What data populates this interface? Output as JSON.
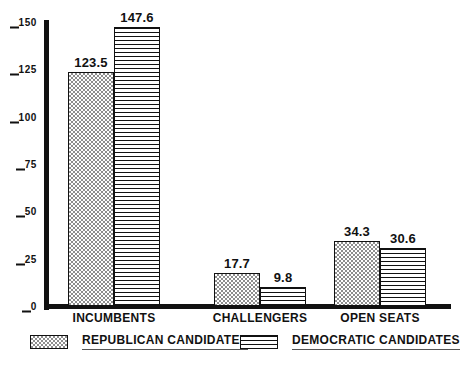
{
  "chart_data": {
    "type": "bar",
    "title": "",
    "subtitle": "",
    "xlabel": "",
    "ylabel": "",
    "ylim": [
      0,
      150
    ],
    "yticks": [
      0,
      25,
      50,
      75,
      100,
      125,
      150
    ],
    "ytick_labels": [
      "0",
      "25",
      "50",
      "75",
      "100",
      "125",
      "150"
    ],
    "grid": false,
    "legend_position": "bottom",
    "categories": [
      "INCUMBENTS",
      "CHALLENGERS",
      "OPEN SEATS"
    ],
    "series": [
      {
        "name": "REPUBLICAN CANDIDATES",
        "pattern": "checkerboard-stipple",
        "values": [
          123.5,
          147.6,
          17.7
        ],
        "value_labels": [
          "123.5",
          "17.7",
          "34.3"
        ],
        "values_by_category": [
          123.5,
          17.7,
          34.3
        ]
      },
      {
        "name": "DEMOCRATIC CANDIDATES",
        "pattern": "horizontal-lines",
        "values": [
          147.6,
          9.8,
          30.6
        ],
        "value_labels": [
          "147.6",
          "9.8",
          "30.6"
        ],
        "values_by_category": [
          147.6,
          9.8,
          30.6
        ]
      }
    ],
    "groups": [
      {
        "category": "INCUMBENTS",
        "bars": [
          {
            "series": "REPUBLICAN CANDIDATES",
            "value": 123.5,
            "label": "123.5"
          },
          {
            "series": "DEMOCRATIC CANDIDATES",
            "value": 147.6,
            "label": "147.6"
          }
        ]
      },
      {
        "category": "CHALLENGERS",
        "bars": [
          {
            "series": "REPUBLICAN CANDIDATES",
            "value": 17.7,
            "label": "17.7"
          },
          {
            "series": "DEMOCRATIC CANDIDATES",
            "value": 9.8,
            "label": "9.8"
          }
        ]
      },
      {
        "category": "OPEN SEATS",
        "bars": [
          {
            "series": "REPUBLICAN CANDIDATES",
            "value": 34.3,
            "label": "34.3"
          },
          {
            "series": "DEMOCRATIC CANDIDATES",
            "value": 30.6,
            "label": "30.6"
          }
        ]
      }
    ],
    "colors": {
      "axis": "#111111",
      "bar_outline": "#111111",
      "republican_fill": "#8e8e8e",
      "democratic_fill": "#111111",
      "background": "#ffffff",
      "text": "#111111",
      "legend_underline": "#555555"
    }
  },
  "legend": {
    "items": [
      {
        "label": "REPUBLICAN CANDIDATES",
        "pattern": "checkerboard-stipple"
      },
      {
        "label": "DEMOCRATIC CANDIDATES",
        "pattern": "horizontal-lines"
      }
    ]
  }
}
